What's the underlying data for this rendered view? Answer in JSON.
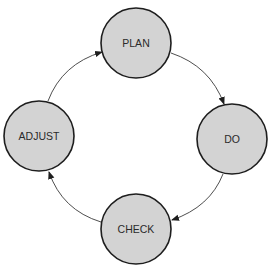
{
  "diagram": {
    "type": "cycle",
    "colors": {
      "node_fill": "#d3d3d3",
      "node_stroke": "#1e1e1e",
      "edge_stroke": "#3a3a3a",
      "label": "#2a2a2a",
      "background": "#ffffff"
    },
    "nodes": [
      {
        "id": "plan",
        "label": "PLAN",
        "cx": 136,
        "cy": 43,
        "r": 35
      },
      {
        "id": "do",
        "label": "DO",
        "cx": 232,
        "cy": 139,
        "r": 35
      },
      {
        "id": "check",
        "label": "CHECK",
        "cx": 136,
        "cy": 229,
        "r": 35
      },
      {
        "id": "adjust",
        "label": "ADJUST",
        "cx": 39,
        "cy": 136,
        "r": 35
      }
    ],
    "edges": [
      {
        "from": "plan",
        "to": "do",
        "path": "M171,53 Q210,66 224,104"
      },
      {
        "from": "do",
        "to": "check",
        "path": "M223,174 Q210,207 172,220"
      },
      {
        "from": "check",
        "to": "adjust",
        "path": "M101,222 Q62,210 49,172"
      },
      {
        "from": "adjust",
        "to": "plan",
        "path": "M48,101 Q62,64 102,52"
      }
    ]
  }
}
